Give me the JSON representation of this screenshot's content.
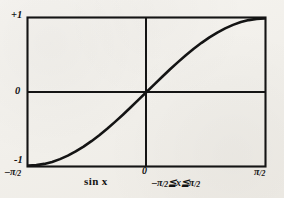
{
  "figure": {
    "background_color": "#f2f0eb",
    "ink_color": "#141414"
  },
  "chart_data": {
    "type": "line",
    "title": "",
    "subtitle": "",
    "function_label": "sin x",
    "domain_label": "-π/2 ≦ x ≦ π/2",
    "xlabel": "",
    "ylabel": "",
    "grid": false,
    "legend": "none",
    "xlim": [
      -1.5707963,
      1.5707963
    ],
    "ylim": [
      -1,
      1
    ],
    "xticks": [
      -1.5707963,
      0,
      1.5707963
    ],
    "xticklabels": [
      "-π/2",
      "0",
      "π/2"
    ],
    "yticks": [
      -1,
      0,
      1
    ],
    "yticklabels": [
      "-1",
      "0",
      "+1"
    ],
    "series": [
      {
        "name": "sin x",
        "x": [
          -1.5708,
          -1.4661,
          -1.3614,
          -1.2566,
          -1.1519,
          -1.0472,
          -0.9425,
          -0.8378,
          -0.733,
          -0.6283,
          -0.5236,
          -0.4189,
          -0.3142,
          -0.2094,
          -0.1047,
          0.0,
          0.1047,
          0.2094,
          0.3142,
          0.4189,
          0.5236,
          0.6283,
          0.733,
          0.8378,
          0.9425,
          1.0472,
          1.1519,
          1.2566,
          1.3614,
          1.4661,
          1.5708
        ],
        "y": [
          -1.0,
          -0.9945,
          -0.9781,
          -0.9511,
          -0.9135,
          -0.866,
          -0.809,
          -0.7431,
          -0.6691,
          -0.5878,
          -0.5,
          -0.4067,
          -0.309,
          -0.2079,
          -0.1045,
          0.0,
          0.1045,
          0.2079,
          0.309,
          0.4067,
          0.5,
          0.5878,
          0.6691,
          0.7431,
          0.809,
          0.866,
          0.9135,
          0.9511,
          0.9781,
          0.9945,
          1.0
        ]
      }
    ]
  },
  "labels": {
    "y_max": "+1",
    "y_zero": "0",
    "y_min": "-1",
    "x_min_pi": "–π",
    "x_min_den": "/2",
    "x_zero": "0",
    "x_max_pi": "π",
    "x_max_den": "/2",
    "function": "sin x",
    "domain_left_pi": "–π",
    "domain_left_den": "/2",
    "domain_op_left": "≦",
    "domain_var": "x",
    "domain_op_right": "≦",
    "domain_right_pi": "π",
    "domain_right_den": "/2"
  }
}
